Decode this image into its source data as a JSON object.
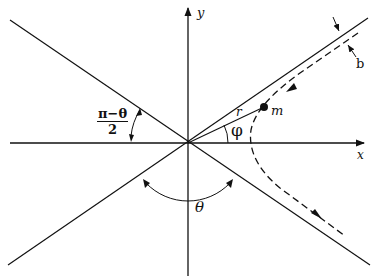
{
  "figure": {
    "colors": {
      "line": "#111111",
      "background": "#ffffff"
    }
  },
  "labels": {
    "y_axis": "y",
    "x_axis": "x",
    "impact_parameter": "b",
    "radius": "r",
    "particle": "m",
    "polar_angle": "φ",
    "scattering_angle": "θ",
    "half_angle_numerator": "π−θ",
    "half_angle_denominator": "2"
  }
}
